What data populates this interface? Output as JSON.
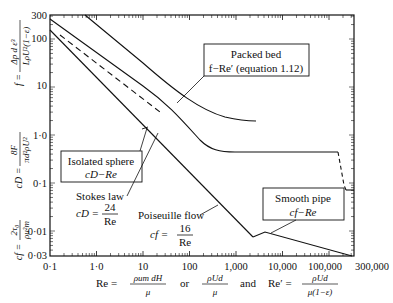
{
  "chart_data": {
    "type": "line",
    "title": "",
    "xscale": "log",
    "yscale": "log",
    "xlim": [
      0.1,
      300000
    ],
    "ylim": [
      0.003,
      300
    ],
    "x_ticks": [
      "0·1",
      "1·0",
      "10",
      "100",
      "1,000",
      "10,000",
      "100,000",
      "300,000"
    ],
    "y_ticks": [
      "300",
      "100",
      "10",
      "1·0",
      "0·1",
      "0·01",
      "0·03"
    ],
    "xlabel": {
      "prefix": "Re =",
      "frac1_num": "ρu_m d_H",
      "frac1_den": "μ",
      "or": "or",
      "frac2_num": "ρUd",
      "frac2_den": "μ",
      "and": "and",
      "prefix2": "Re′ =",
      "frac3_num": "ρUd",
      "frac3_den": "μ(1−ε)"
    },
    "ylabel": {
      "f": "f =",
      "f_num": "Δp d ε³",
      "f_den": "LρU²(1−ε)",
      "cd": "c_D =",
      "cd_num": "8F",
      "cd_den": "πd²ρU²",
      "cf": "c_f =",
      "cf_num": "2τ₀",
      "cf_den": "ρu²_m"
    },
    "series": [
      {
        "name": "Packed bed f−Re′",
        "x": [
          1.6,
          10,
          100,
          1000,
          2500
        ],
        "y": [
          300,
          45,
          6.5,
          2.0,
          1.6
        ]
      },
      {
        "name": "Isolated sphere c_D−Re",
        "x": [
          0.1,
          1,
          10,
          100,
          1000,
          200000,
          300000
        ],
        "y": [
          240,
          27,
          4.2,
          1.1,
          0.44,
          0.44,
          0.1
        ]
      },
      {
        "name": "Stokes law c_D = 24/Re",
        "x": [
          0.5,
          30
        ],
        "y": [
          48,
          0.8
        ],
        "style": "dashed"
      },
      {
        "name": "Poiseuille flow c_f = 16/Re",
        "x": [
          0.1,
          2000
        ],
        "y": [
          160,
          0.008
        ]
      },
      {
        "name": "Smooth pipe c_f−Re",
        "x": [
          2000,
          3000,
          300000
        ],
        "y": [
          0.008,
          0.0105,
          0.0035
        ]
      }
    ],
    "annotations": [
      {
        "text": "Packed bed",
        "sub": "f−Re′ (equation 1.12)"
      },
      {
        "text": "Isolated sphere",
        "sub": "c_D−Re"
      },
      {
        "text": "Stokes law",
        "sub": "c_D = 24/Re"
      },
      {
        "text": "Poiseuille flow",
        "sub": "c_f = 16/Re"
      },
      {
        "text": "Smooth pipe",
        "sub": "c_f−Re"
      }
    ],
    "grid": false,
    "legend": "none"
  },
  "labels": {
    "packed_title": "Packed bed",
    "packed_sub": "f−Re′ (equation 1.12)",
    "sphere_title": "Isolated sphere",
    "sphere_sub": "cD−Re",
    "stokes_title": "Stokes law",
    "stokes_eq": "cD =",
    "stokes_num": "24",
    "stokes_den": "Re",
    "pois_title": "Poiseuille flow",
    "pois_eq": "cf =",
    "pois_num": "16",
    "pois_den": "Re",
    "pipe_title": "Smooth pipe",
    "pipe_sub": "cf−Re"
  }
}
